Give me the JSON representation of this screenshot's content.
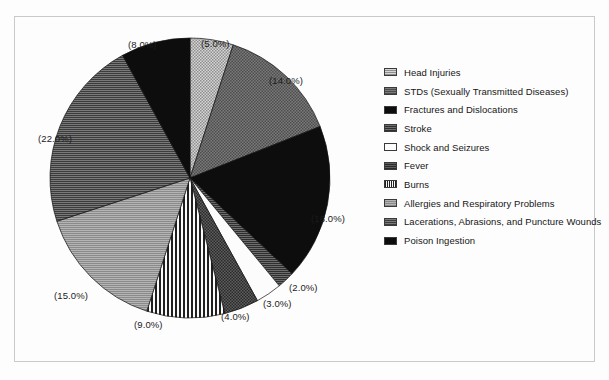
{
  "frame": {
    "caption": ""
  },
  "chart_data": {
    "type": "pie",
    "title": "",
    "subtitle": "",
    "xlabel": "",
    "ylabel": "",
    "legend_position": "right",
    "grid": false,
    "start_angle_deg": 0,
    "direction": "clockwise",
    "labels": [
      "Head Injuries",
      "STDs (Sexually Transmitted Diseases)",
      "Fractures and Dislocations",
      "Stroke",
      "Shock and Seizures",
      "Fever",
      "Burns",
      "Allergies and Respiratory Problems",
      "Lacerations, Abrasions, and Puncture Wounds",
      "Poison Ingestion"
    ],
    "values": [
      5.0,
      14.0,
      18.0,
      2.0,
      3.0,
      4.0,
      9.0,
      15.0,
      22.0,
      8.0
    ],
    "value_labels": [
      "(5.0%)",
      "(14.0%)",
      "(18.0%)",
      "(2.0%)",
      "(3.0%)",
      "(4.0%)",
      "(9.0%)",
      "(15.0%)",
      "(22.0%)",
      "(8.0%)"
    ],
    "fills": [
      "#9a9a9a",
      "#6e6e6e",
      "#0d0d0d",
      "#585858",
      "#fbfbfb",
      "#4a4a4a",
      "#2e2e2e",
      "#8d8d8d",
      "#5a5a5a",
      "#0d0d0d"
    ],
    "patterns": [
      "dots-light",
      "crosshatch-medium",
      "solid-black",
      "horizontal-dark",
      "solid-white",
      "dots-dark",
      "vertical-stripes",
      "horizontal-light",
      "horizontal-medium",
      "solid-black"
    ]
  },
  "legend": {
    "items": [
      {
        "label": "Head Injuries"
      },
      {
        "label": "STDs (Sexually Transmitted Diseases)"
      },
      {
        "label": "Fractures and Dislocations"
      },
      {
        "label": "Stroke"
      },
      {
        "label": "Shock and Seizures"
      },
      {
        "label": "Fever"
      },
      {
        "label": "Burns"
      },
      {
        "label": "Allergies and Respiratory Problems"
      },
      {
        "label": "Lacerations, Abrasions, and Puncture Wounds"
      },
      {
        "label": "Poison Ingestion"
      }
    ]
  },
  "colors": {
    "background": "#fdfdfd",
    "border": "#c9c9c9",
    "text": "#161616"
  }
}
